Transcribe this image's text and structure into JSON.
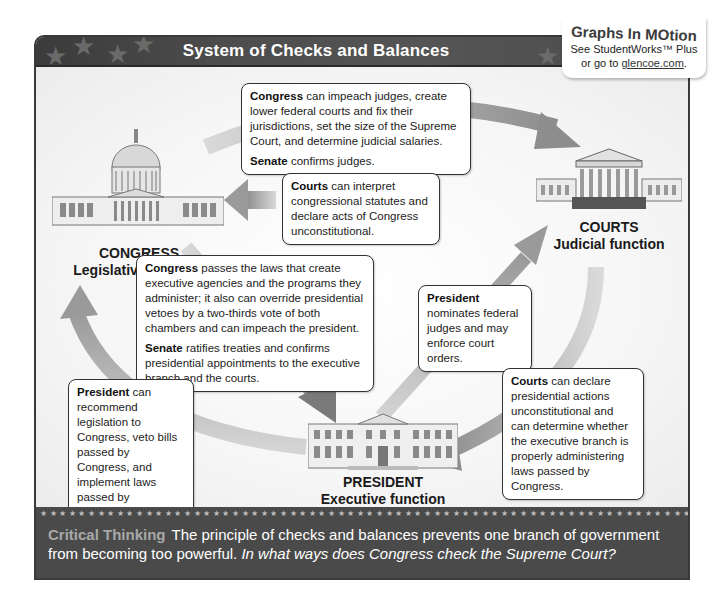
{
  "title": "System of Checks and Balances",
  "badge": {
    "title": "Graphs In MOtion",
    "line1": "See StudentWorks™ Plus",
    "line2_prefix": "or go to ",
    "link": "glencoe.com",
    "line2_suffix": "."
  },
  "branches": {
    "congress": {
      "name": "CONGRESS",
      "function": "Legislative function",
      "icon": "capitol-building-icon"
    },
    "courts": {
      "name": "COURTS",
      "function": "Judicial function",
      "icon": "supreme-court-building-icon"
    },
    "president": {
      "name": "PRESIDENT",
      "function": "Executive function",
      "icon": "white-house-icon"
    }
  },
  "boxes": {
    "congress_to_courts": {
      "p1_bold": "Congress",
      "p1_text": " can impeach judges, create lower federal courts and fix their jurisdictions, set the size of the Supreme Court, and determine judicial salaries.",
      "p2_bold": "Senate",
      "p2_text": " confirms judges."
    },
    "courts_to_congress": {
      "p1_bold": "Courts",
      "p1_text": " can interpret congressional statutes and declare acts of Congress unconstitutional."
    },
    "congress_to_president": {
      "p1_bold": "Congress",
      "p1_text": " passes the laws that create executive agencies and the programs they administer; it also can override presidential vetoes by a two-thirds vote of both chambers and can impeach the president.",
      "p2_bold": "Senate",
      "p2_text": " ratifies treaties and confirms presidential appointments to the executive branch and the courts."
    },
    "president_to_courts": {
      "p1_bold": "President",
      "p1_text": " nominates federal judges and may enforce court orders."
    },
    "president_to_congress": {
      "p1_bold": "President",
      "p1_text": " can recommend legislation to Congress, veto bills passed by Congress, and implement laws passed by Congress."
    },
    "courts_to_president": {
      "p1_bold": "Courts",
      "p1_text": " can declare presidential actions unconstitutional and can determine whether the executive branch is properly administering laws passed by Congress."
    }
  },
  "footer": {
    "label": "Critical Thinking",
    "text": "The principle of checks and balances prevents one branch of government from becoming too powerful. ",
    "question": "In what ways does Congress check the Supreme Court?"
  },
  "colors": {
    "header_bg": "#4a4a4a",
    "arrow": "#a0a0a0",
    "footer_bg": "#4a4a4a",
    "critical_label": "#a8a8a8"
  }
}
